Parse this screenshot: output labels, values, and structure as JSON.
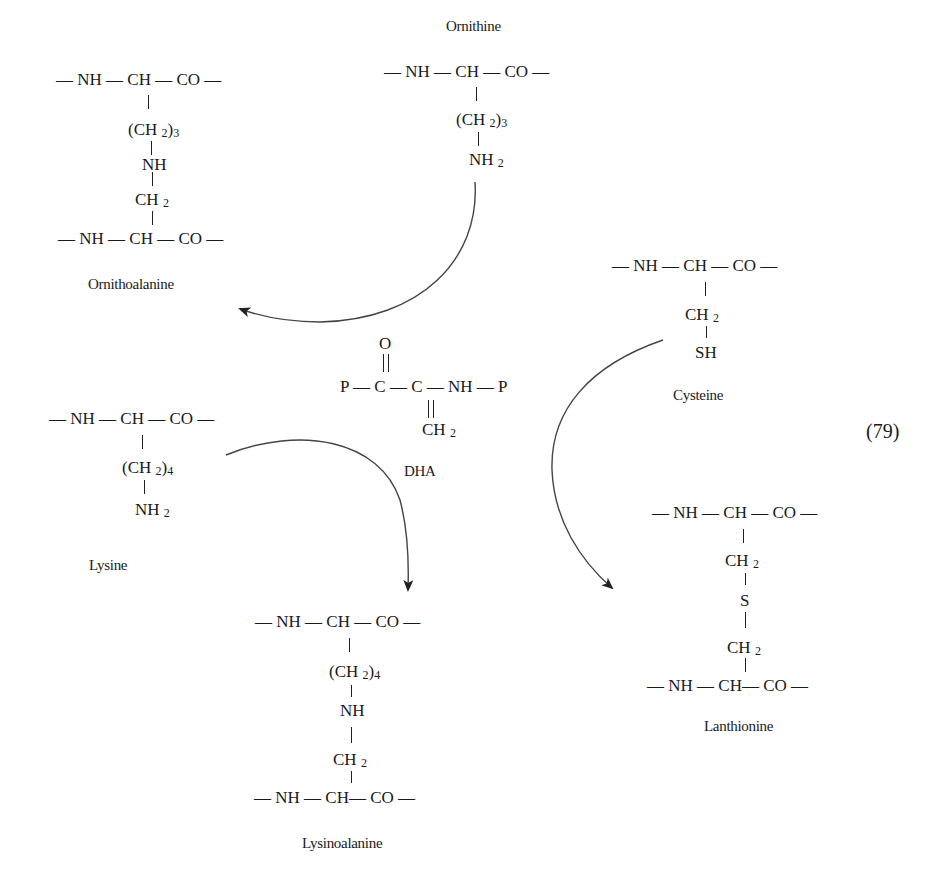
{
  "equation_number": "(79)",
  "ornithine": {
    "label": "Ornithine",
    "backbone": "— NH — CH — CO —",
    "side1": "(CH 2)3",
    "side2": "NH 2"
  },
  "ornithoalanine": {
    "label": "Ornithoalanine",
    "backbone_top": "— NH — CH — CO —",
    "side1": "(CH 2)3",
    "side2": "NH",
    "side3": "CH 2",
    "backbone_bottom": "— NH — CH — CO —"
  },
  "dha": {
    "label": "DHA",
    "oxygen": "O",
    "chain": "P — C — C — NH — P",
    "methylene": "CH 2"
  },
  "cysteine": {
    "label": "Cysteine",
    "backbone": "— NH — CH — CO —",
    "side1": "CH 2",
    "side2": "SH"
  },
  "lysine": {
    "label": "Lysine",
    "backbone": "— NH — CH — CO —",
    "side1": "(CH 2)4",
    "side2": "NH 2"
  },
  "lysinoalanine": {
    "label": "Lysinoalanine",
    "backbone_top": "— NH — CH — CO —",
    "side1": "(CH 2)4",
    "side2": "NH",
    "side3": "CH 2",
    "backbone_bottom": "— NH — CH— CO —"
  },
  "lanthionine": {
    "label": "Lanthionine",
    "backbone_top": "— NH — CH — CO —",
    "side1": "CH 2",
    "side2": "S",
    "side3": "CH 2",
    "backbone_bottom": "— NH — CH— CO —"
  },
  "arrows": [
    {
      "from": "ornithine",
      "to": "ornithoalanine"
    },
    {
      "from": "lysine",
      "to": "lysinoalanine"
    },
    {
      "from": "cysteine",
      "to": "lanthionine"
    }
  ]
}
